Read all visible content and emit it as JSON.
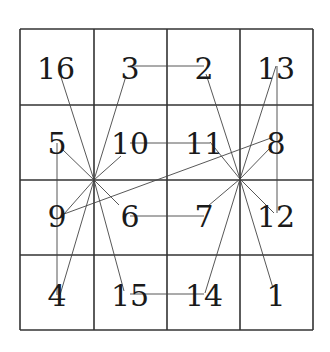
{
  "diagram": {
    "type": "magic-square-4x4",
    "grid": {
      "rows": 4,
      "cols": 4,
      "x": [
        20,
        94,
        167,
        240,
        313
      ],
      "y": [
        29,
        105,
        180,
        255,
        330
      ],
      "line_color": "#333333"
    },
    "cells": [
      {
        "row": 0,
        "col": 0,
        "value": "16",
        "cx": 56,
        "cy": 68
      },
      {
        "row": 0,
        "col": 1,
        "value": "3",
        "cx": 130,
        "cy": 68
      },
      {
        "row": 0,
        "col": 2,
        "value": "2",
        "cx": 204,
        "cy": 68
      },
      {
        "row": 0,
        "col": 3,
        "value": "13",
        "cx": 276,
        "cy": 68
      },
      {
        "row": 1,
        "col": 0,
        "value": "5",
        "cx": 57,
        "cy": 143
      },
      {
        "row": 1,
        "col": 1,
        "value": "10",
        "cx": 130,
        "cy": 143
      },
      {
        "row": 1,
        "col": 2,
        "value": "11",
        "cx": 204,
        "cy": 143
      },
      {
        "row": 1,
        "col": 3,
        "value": "8",
        "cx": 276,
        "cy": 143
      },
      {
        "row": 2,
        "col": 0,
        "value": "9",
        "cx": 57,
        "cy": 216
      },
      {
        "row": 2,
        "col": 1,
        "value": "6",
        "cx": 130,
        "cy": 216
      },
      {
        "row": 2,
        "col": 2,
        "value": "7",
        "cx": 204,
        "cy": 216
      },
      {
        "row": 2,
        "col": 3,
        "value": "12",
        "cx": 276,
        "cy": 216
      },
      {
        "row": 3,
        "col": 0,
        "value": "4",
        "cx": 57,
        "cy": 295
      },
      {
        "row": 3,
        "col": 1,
        "value": "15",
        "cx": 130,
        "cy": 295
      },
      {
        "row": 3,
        "col": 2,
        "value": "14",
        "cx": 204,
        "cy": 295
      },
      {
        "row": 3,
        "col": 3,
        "value": "1",
        "cx": 276,
        "cy": 295
      }
    ],
    "hubs": [
      {
        "name": "left-hub",
        "x": 94,
        "y": 180
      },
      {
        "name": "right-hub",
        "x": 240,
        "y": 179
      }
    ],
    "links": [
      {
        "from": "left-hub",
        "x1": 94,
        "y1": 180,
        "x2": 60,
        "y2": 74
      },
      {
        "from": "left-hub",
        "x1": 94,
        "y1": 180,
        "x2": 126,
        "y2": 76
      },
      {
        "from": "left-hub",
        "x1": 94,
        "y1": 180,
        "x2": 62,
        "y2": 149
      },
      {
        "from": "left-hub",
        "x1": 94,
        "y1": 180,
        "x2": 121,
        "y2": 156
      },
      {
        "from": "left-hub",
        "x1": 94,
        "y1": 180,
        "x2": 64,
        "y2": 214
      },
      {
        "from": "left-hub",
        "x1": 94,
        "y1": 180,
        "x2": 119,
        "y2": 205
      },
      {
        "from": "left-hub",
        "x1": 94,
        "y1": 180,
        "x2": 60,
        "y2": 295
      },
      {
        "from": "left-hub",
        "x1": 94,
        "y1": 180,
        "x2": 124,
        "y2": 291
      },
      {
        "from": "right-hub",
        "x1": 240,
        "y1": 179,
        "x2": 206,
        "y2": 74
      },
      {
        "from": "right-hub",
        "x1": 240,
        "y1": 179,
        "x2": 276,
        "y2": 66
      },
      {
        "from": "right-hub",
        "x1": 240,
        "y1": 179,
        "x2": 210,
        "y2": 142
      },
      {
        "from": "right-hub",
        "x1": 240,
        "y1": 179,
        "x2": 271,
        "y2": 147
      },
      {
        "from": "right-hub",
        "x1": 240,
        "y1": 179,
        "x2": 208,
        "y2": 206
      },
      {
        "from": "right-hub",
        "x1": 240,
        "y1": 179,
        "x2": 274,
        "y2": 213
      },
      {
        "from": "right-hub",
        "x1": 240,
        "y1": 179,
        "x2": 205,
        "y2": 293
      },
      {
        "from": "right-hub",
        "x1": 240,
        "y1": 179,
        "x2": 273,
        "y2": 288
      },
      {
        "from": "9-to-8",
        "x1": 64,
        "y1": 214,
        "x2": 271,
        "y2": 138
      },
      {
        "from": "3-to-2",
        "x1": 130,
        "y1": 66,
        "x2": 204,
        "y2": 66
      },
      {
        "from": "10-to-11",
        "x1": 130,
        "y1": 143,
        "x2": 199,
        "y2": 143
      },
      {
        "from": "11-tail",
        "x1": 199,
        "y1": 143,
        "x2": 210,
        "y2": 143
      },
      {
        "from": "6-to-7",
        "x1": 130,
        "y1": 216,
        "x2": 204,
        "y2": 216
      },
      {
        "from": "15-to-14",
        "x1": 130,
        "y1": 294,
        "x2": 204,
        "y2": 294
      },
      {
        "from": "5-to-4",
        "x1": 57,
        "y1": 143,
        "x2": 57,
        "y2": 295
      },
      {
        "from": "13-to-12",
        "x1": 277,
        "y1": 66,
        "x2": 277,
        "y2": 213
      }
    ]
  }
}
